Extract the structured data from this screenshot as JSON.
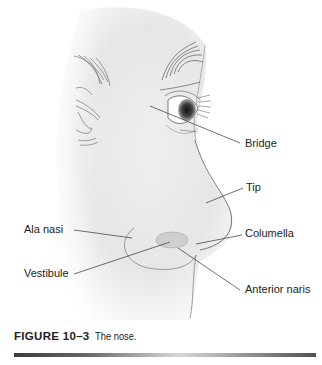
{
  "figure": {
    "subject": "nose",
    "labels": {
      "bridge": "Bridge",
      "tip": "Tip",
      "ala_nasi": "Ala nasi",
      "columella": "Columella",
      "vestibule": "Vestibule",
      "anterior_naris": "Anterior naris"
    }
  },
  "caption": {
    "number": "FIGURE 10–3",
    "text": "The nose."
  }
}
